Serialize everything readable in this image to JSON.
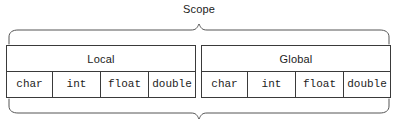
{
  "diagram": {
    "title": "Scope",
    "top_brace": "curly-brace-down",
    "bottom_brace": "curly-brace-up",
    "bottom_caption": "",
    "line_color": "#3a3a3a",
    "brace_color": "#555555",
    "text_color": "#1c1c1c",
    "background": "#ffffff"
  },
  "table": {
    "groups": [
      {
        "label": "Local"
      },
      {
        "label": "Global"
      }
    ],
    "types": {
      "local": [
        "char",
        "int",
        "float",
        "double"
      ],
      "global": [
        "char",
        "int",
        "float",
        "double"
      ]
    }
  }
}
